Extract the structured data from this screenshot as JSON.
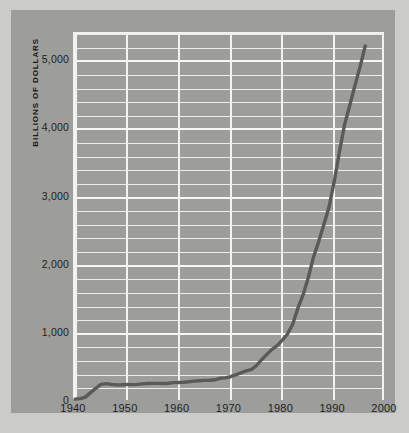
{
  "chart_data": {
    "type": "line",
    "title": "",
    "xlabel": "",
    "ylabel": "BILLIONS OF DOLLARS",
    "xlim": [
      1940,
      2000
    ],
    "ylim": [
      0,
      5400
    ],
    "grid": true,
    "legend": "none",
    "y_major_ticks": [
      "0",
      "1,000",
      "2,000",
      "3,000",
      "4,000",
      "5,000"
    ],
    "y_major_values": [
      0,
      1000,
      2000,
      3000,
      4000,
      5000
    ],
    "y_minor_step": 200,
    "x_ticks": [
      "1940",
      "1950",
      "1960",
      "1970",
      "1980",
      "1990",
      "2000"
    ],
    "x_tick_values": [
      1940,
      1950,
      1960,
      1970,
      1980,
      1990,
      2000
    ],
    "line_color": "#5a5a58",
    "grid_color": "#f2f2ef",
    "panel_color": "#9d9d9b",
    "series": [
      {
        "name": "Total debt",
        "x": [
          1940,
          1941,
          1942,
          1943,
          1944,
          1945,
          1946,
          1947,
          1948,
          1949,
          1950,
          1951,
          1952,
          1953,
          1954,
          1955,
          1956,
          1957,
          1958,
          1959,
          1960,
          1961,
          1962,
          1963,
          1964,
          1965,
          1966,
          1967,
          1968,
          1969,
          1970,
          1971,
          1972,
          1973,
          1974,
          1975,
          1976,
          1977,
          1978,
          1979,
          1980,
          1981,
          1982,
          1983,
          1984,
          1985,
          1986,
          1987,
          1988,
          1989,
          1990,
          1991,
          1992,
          1993,
          1994,
          1995,
          1996
        ],
        "values": [
          43,
          49,
          72,
          137,
          201,
          259,
          269,
          258,
          252,
          253,
          257,
          255,
          259,
          266,
          271,
          274,
          273,
          271,
          276,
          285,
          287,
          289,
          298,
          306,
          312,
          317,
          320,
          326,
          348,
          354,
          371,
          398,
          427,
          458,
          475,
          533,
          620,
          699,
          772,
          827,
          908,
          998,
          1142,
          1377,
          1572,
          1823,
          2125,
          2350,
          2602,
          2857,
          3233,
          3665,
          4065,
          4351,
          4643,
          4921,
          5225
        ]
      }
    ]
  },
  "axis_title": {
    "y": "BILLIONS OF DOLLARS"
  }
}
